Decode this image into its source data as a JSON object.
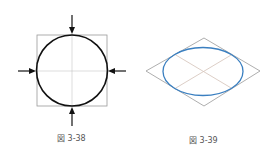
{
  "figures": [
    {
      "id": "fig-3-38",
      "caption": "図 3-38",
      "description": "Circle inscribed in a square with center lines and four inward-pointing arrows",
      "stroke_color": "#111111",
      "frame_color": "#999999"
    },
    {
      "id": "fig-3-39",
      "caption": "図 3-39",
      "description": "Ellipse inscribed in a rhombus (isometric circle) with diagonal center lines",
      "ellipse_color": "#3a7fc0",
      "frame_color": "#999999",
      "centerline_color": "#d8c8c0"
    }
  ]
}
